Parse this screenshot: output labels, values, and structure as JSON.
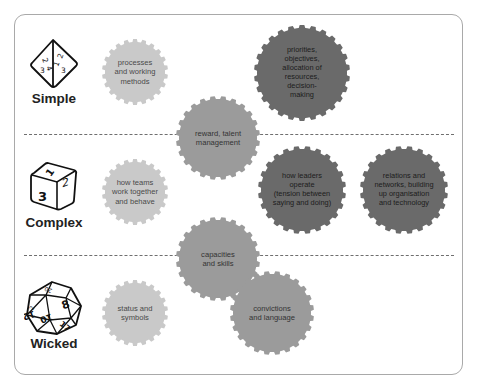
{
  "diagram": {
    "categories": [
      {
        "label": "Simple",
        "icon": "tetrahedron-die-icon",
        "die_numbers": [
          "2",
          "4",
          "3",
          "1",
          "2",
          "3"
        ]
      },
      {
        "label": "Complex",
        "icon": "cube-die-icon",
        "die_numbers": [
          "1",
          "3",
          "2"
        ]
      },
      {
        "label": "Wicked",
        "icon": "icosahedron-die-icon",
        "die_numbers": [
          "20",
          "8",
          "12",
          "10",
          "17",
          "2"
        ]
      }
    ],
    "gears": [
      {
        "id": "processes",
        "text": "processes\nand working\nmethods",
        "tone": "light"
      },
      {
        "id": "priorities",
        "text": "priorities,\nobjectives,\nallocation of\nresources,\ndecision-\nmaking",
        "tone": "dark"
      },
      {
        "id": "reward",
        "text": "reward, talent\nmanagement",
        "tone": "medium"
      },
      {
        "id": "teams",
        "text": "how teams\nwork together\nand behave",
        "tone": "light"
      },
      {
        "id": "leaders",
        "text": "how leaders\noperate\n(tension between\nsaying and doing)",
        "tone": "dark"
      },
      {
        "id": "relations",
        "text": "relations and\nnetworks, building\nup organisation\nand technology",
        "tone": "dark"
      },
      {
        "id": "capacities",
        "text": "capacities\nand skills",
        "tone": "medium"
      },
      {
        "id": "status",
        "text": "status and\nsymbols",
        "tone": "light"
      },
      {
        "id": "convictions",
        "text": "convictions\nand language",
        "tone": "medium"
      }
    ],
    "colors": {
      "light": "#c9c9c9",
      "medium": "#9b9b9b",
      "dark": "#6a6a6a",
      "frame": "#a9a9a9",
      "divider": "#6f6f6f"
    }
  }
}
